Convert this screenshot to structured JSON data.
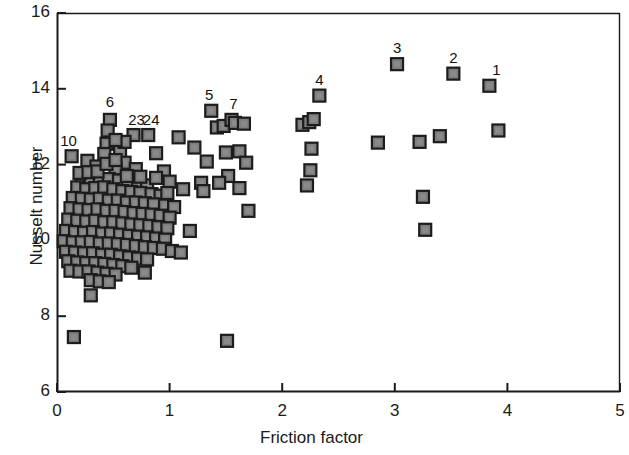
{
  "chart_data": {
    "type": "scatter",
    "title": "",
    "xlabel": "Friction factor",
    "ylabel": "Nusselt number",
    "xlim": [
      0,
      5
    ],
    "ylim": [
      6,
      16
    ],
    "xticks": [
      0,
      1,
      2,
      3,
      4,
      5
    ],
    "yticks": [
      6,
      8,
      10,
      12,
      14,
      16
    ],
    "xtick_labels": [
      "0",
      "1",
      "2",
      "3",
      "4",
      "5"
    ],
    "ytick_labels": [
      "6",
      "8",
      "10",
      "12",
      "14",
      "16"
    ],
    "grid": false,
    "legend": null,
    "marker": {
      "shape": "square",
      "fill": "#7d7d7d",
      "edge": "#1c1c1c",
      "size_px": 12
    },
    "annotations": [
      {
        "label": "1",
        "x": 3.84,
        "y": 14.08,
        "dx": 7,
        "dy": -17
      },
      {
        "label": "2",
        "x": 3.52,
        "y": 14.4,
        "dx": 0,
        "dy": -17
      },
      {
        "label": "3",
        "x": 3.02,
        "y": 14.65,
        "dx": 0,
        "dy": -17
      },
      {
        "label": "4",
        "x": 2.33,
        "y": 13.82,
        "dx": 0,
        "dy": -17
      },
      {
        "label": "5",
        "x": 1.37,
        "y": 13.42,
        "dx": -2,
        "dy": -17
      },
      {
        "label": "6",
        "x": 0.47,
        "y": 13.18,
        "dx": 0,
        "dy": -19
      },
      {
        "label": "7",
        "x": 1.55,
        "y": 13.18,
        "dx": 2,
        "dy": -17
      },
      {
        "label": "10",
        "x": 0.13,
        "y": 12.22,
        "dx": -3,
        "dy": -16
      },
      {
        "label": "23",
        "x": 0.68,
        "y": 12.78,
        "dx": 3,
        "dy": -16
      },
      {
        "label": "24",
        "x": 0.81,
        "y": 12.78,
        "dx": 3,
        "dy": -16
      }
    ],
    "points": [
      [
        0.15,
        7.45
      ],
      [
        0.3,
        8.55
      ],
      [
        0.78,
        9.15
      ],
      [
        1.51,
        7.35
      ],
      [
        0.13,
        12.22
      ],
      [
        0.47,
        13.18
      ],
      [
        0.45,
        12.9
      ],
      [
        0.44,
        12.55
      ],
      [
        0.42,
        12.28
      ],
      [
        0.68,
        12.78
      ],
      [
        0.81,
        12.78
      ],
      [
        1.08,
        12.72
      ],
      [
        0.27,
        12.1
      ],
      [
        0.56,
        12.35
      ],
      [
        0.6,
        12.05
      ],
      [
        0.88,
        12.3
      ],
      [
        0.35,
        11.95
      ],
      [
        0.52,
        11.9
      ],
      [
        0.7,
        11.88
      ],
      [
        0.95,
        11.82
      ],
      [
        1.0,
        11.55
      ],
      [
        1.12,
        11.35
      ],
      [
        1.18,
        10.25
      ],
      [
        0.22,
        11.6
      ],
      [
        0.3,
        11.55
      ],
      [
        0.38,
        11.6
      ],
      [
        0.46,
        11.62
      ],
      [
        0.55,
        11.58
      ],
      [
        0.63,
        11.52
      ],
      [
        0.72,
        11.5
      ],
      [
        0.8,
        11.45
      ],
      [
        0.18,
        11.4
      ],
      [
        0.26,
        11.35
      ],
      [
        0.34,
        11.38
      ],
      [
        0.42,
        11.4
      ],
      [
        0.5,
        11.35
      ],
      [
        0.58,
        11.3
      ],
      [
        0.66,
        11.28
      ],
      [
        0.74,
        11.25
      ],
      [
        0.84,
        11.22
      ],
      [
        0.92,
        11.18
      ],
      [
        0.14,
        11.12
      ],
      [
        0.22,
        11.1
      ],
      [
        0.3,
        11.08
      ],
      [
        0.38,
        11.1
      ],
      [
        0.46,
        11.05
      ],
      [
        0.54,
        11.05
      ],
      [
        0.62,
        11.0
      ],
      [
        0.7,
        11.0
      ],
      [
        0.78,
        10.98
      ],
      [
        0.86,
        10.95
      ],
      [
        0.96,
        10.92
      ],
      [
        1.04,
        10.88
      ],
      [
        0.12,
        10.85
      ],
      [
        0.2,
        10.82
      ],
      [
        0.28,
        10.8
      ],
      [
        0.36,
        10.82
      ],
      [
        0.44,
        10.78
      ],
      [
        0.52,
        10.78
      ],
      [
        0.6,
        10.75
      ],
      [
        0.68,
        10.72
      ],
      [
        0.76,
        10.7
      ],
      [
        0.84,
        10.68
      ],
      [
        0.92,
        10.65
      ],
      [
        1.0,
        10.6
      ],
      [
        0.1,
        10.55
      ],
      [
        0.18,
        10.52
      ],
      [
        0.26,
        10.5
      ],
      [
        0.34,
        10.52
      ],
      [
        0.42,
        10.48
      ],
      [
        0.5,
        10.48
      ],
      [
        0.58,
        10.45
      ],
      [
        0.66,
        10.42
      ],
      [
        0.74,
        10.4
      ],
      [
        0.82,
        10.38
      ],
      [
        0.9,
        10.35
      ],
      [
        0.98,
        10.32
      ],
      [
        0.08,
        10.25
      ],
      [
        0.16,
        10.22
      ],
      [
        0.24,
        10.2
      ],
      [
        0.32,
        10.22
      ],
      [
        0.4,
        10.18
      ],
      [
        0.48,
        10.18
      ],
      [
        0.56,
        10.15
      ],
      [
        0.64,
        10.12
      ],
      [
        0.72,
        10.1
      ],
      [
        0.8,
        10.08
      ],
      [
        0.88,
        10.05
      ],
      [
        0.96,
        10.02
      ],
      [
        0.06,
        9.98
      ],
      [
        0.14,
        9.95
      ],
      [
        0.22,
        9.95
      ],
      [
        0.3,
        9.96
      ],
      [
        0.38,
        9.92
      ],
      [
        0.46,
        9.92
      ],
      [
        0.54,
        9.9
      ],
      [
        0.62,
        9.88
      ],
      [
        0.7,
        9.85
      ],
      [
        0.78,
        9.82
      ],
      [
        0.86,
        9.8
      ],
      [
        0.94,
        9.78
      ],
      [
        1.02,
        9.72
      ],
      [
        1.1,
        9.68
      ],
      [
        0.08,
        9.7
      ],
      [
        0.16,
        9.68
      ],
      [
        0.24,
        9.66
      ],
      [
        0.32,
        9.66
      ],
      [
        0.4,
        9.62
      ],
      [
        0.48,
        9.62
      ],
      [
        0.56,
        9.58
      ],
      [
        0.64,
        9.55
      ],
      [
        0.72,
        9.52
      ],
      [
        0.8,
        9.5
      ],
      [
        0.1,
        9.45
      ],
      [
        0.18,
        9.42
      ],
      [
        0.26,
        9.4
      ],
      [
        0.34,
        9.4
      ],
      [
        0.42,
        9.38
      ],
      [
        0.5,
        9.35
      ],
      [
        0.58,
        9.32
      ],
      [
        0.66,
        9.28
      ],
      [
        0.12,
        9.2
      ],
      [
        0.2,
        9.18
      ],
      [
        0.28,
        9.18
      ],
      [
        0.36,
        9.15
      ],
      [
        0.44,
        9.12
      ],
      [
        0.52,
        9.1
      ],
      [
        0.3,
        8.95
      ],
      [
        0.38,
        8.92
      ],
      [
        0.46,
        8.9
      ],
      [
        0.2,
        11.78
      ],
      [
        0.28,
        11.8
      ],
      [
        0.36,
        11.82
      ],
      [
        0.44,
        12.02
      ],
      [
        0.52,
        12.12
      ],
      [
        0.62,
        11.7
      ],
      [
        0.74,
        11.68
      ],
      [
        0.88,
        11.65
      ],
      [
        0.98,
        11.25
      ],
      [
        0.6,
        12.6
      ],
      [
        0.52,
        12.65
      ],
      [
        1.22,
        12.45
      ],
      [
        1.28,
        11.52
      ],
      [
        1.3,
        11.3
      ],
      [
        1.37,
        13.42
      ],
      [
        1.42,
        12.98
      ],
      [
        1.48,
        13.02
      ],
      [
        1.5,
        12.32
      ],
      [
        1.52,
        11.7
      ],
      [
        1.55,
        13.18
      ],
      [
        1.58,
        13.1
      ],
      [
        1.62,
        12.35
      ],
      [
        1.66,
        13.08
      ],
      [
        1.68,
        12.05
      ],
      [
        1.7,
        10.78
      ],
      [
        1.62,
        11.38
      ],
      [
        1.44,
        11.52
      ],
      [
        1.33,
        12.08
      ],
      [
        2.18,
        13.05
      ],
      [
        2.24,
        13.12
      ],
      [
        2.28,
        13.2
      ],
      [
        2.26,
        12.42
      ],
      [
        2.25,
        11.85
      ],
      [
        2.22,
        11.45
      ],
      [
        2.33,
        13.82
      ],
      [
        2.85,
        12.58
      ],
      [
        3.02,
        14.65
      ],
      [
        3.22,
        12.6
      ],
      [
        3.25,
        11.15
      ],
      [
        3.27,
        10.28
      ],
      [
        3.4,
        12.75
      ],
      [
        3.52,
        14.4
      ],
      [
        3.84,
        14.08
      ],
      [
        3.92,
        12.9
      ]
    ]
  },
  "axes": {
    "x_title": "Friction factor",
    "y_title": "Nusselt number"
  }
}
